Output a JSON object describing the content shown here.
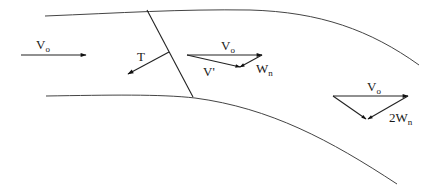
{
  "diagram": {
    "title": "",
    "labels": {
      "inlet_velocity": {
        "main": "V",
        "sub": "o"
      },
      "thrust": {
        "main": "T"
      },
      "mid_freestream": {
        "main": "V",
        "sub": "o"
      },
      "mid_resultant": {
        "main": "V'"
      },
      "mid_induced": {
        "main": "W",
        "sub": "n"
      },
      "far_freestream": {
        "main": "V",
        "sub": "o"
      },
      "far_induced": {
        "main": "2W",
        "sub": "n"
      }
    },
    "colors": {
      "line": "#222222",
      "wall": "#444444",
      "background": "#ffffff"
    }
  }
}
